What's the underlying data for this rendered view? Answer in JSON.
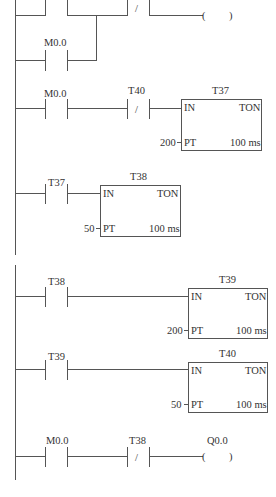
{
  "diagram": {
    "type": "ladder-logic",
    "rungs": [
      {
        "id": 1,
        "elements": [
          {
            "kind": "contact-no",
            "label": ""
          },
          {
            "kind": "contact-no-parallel",
            "label": "M0.0"
          },
          {
            "kind": "contact-nc",
            "label": ""
          },
          {
            "kind": "coil",
            "label": ""
          }
        ]
      },
      {
        "id": 2,
        "elements": [
          {
            "kind": "contact-no",
            "label": "M0.0"
          },
          {
            "kind": "contact-nc",
            "label": "T40"
          },
          {
            "kind": "timer",
            "name": "T37",
            "in": "IN",
            "type": "TON",
            "pt_label": "PT",
            "pt_value": "200",
            "base": "100 ms"
          }
        ]
      },
      {
        "id": 3,
        "elements": [
          {
            "kind": "contact-no",
            "label": "T37"
          },
          {
            "kind": "timer",
            "name": "T38",
            "in": "IN",
            "type": "TON",
            "pt_label": "PT",
            "pt_value": "50",
            "base": "100 ms"
          }
        ]
      },
      {
        "id": 4,
        "elements": [
          {
            "kind": "contact-no",
            "label": "T38"
          },
          {
            "kind": "timer",
            "name": "T39",
            "in": "IN",
            "type": "TON",
            "pt_label": "PT",
            "pt_value": "200",
            "base": "100 ms"
          }
        ]
      },
      {
        "id": 5,
        "elements": [
          {
            "kind": "contact-no",
            "label": "T39"
          },
          {
            "kind": "timer",
            "name": "T40",
            "in": "IN",
            "type": "TON",
            "pt_label": "PT",
            "pt_value": "50",
            "base": "100 ms"
          }
        ]
      },
      {
        "id": 6,
        "elements": [
          {
            "kind": "contact-no",
            "label": "M0.0"
          },
          {
            "kind": "contact-nc",
            "label": "T38"
          },
          {
            "kind": "coil",
            "label": "Q0.0"
          }
        ]
      }
    ],
    "labels": {
      "r1_parallel": "M0.0",
      "r2_contact": "M0.0",
      "r2_nc": "T40",
      "r2_timer": "T37",
      "r3_contact": "T37",
      "r3_timer": "T38",
      "r4_contact": "T38",
      "r4_timer": "T39",
      "r5_contact": "T39",
      "r5_timer": "T40",
      "r6_contact": "M0.0",
      "r6_nc": "T38",
      "r6_coil": "Q0.0",
      "in": "IN",
      "ton": "TON",
      "pt": "PT",
      "base": "100 ms",
      "pt200": "200",
      "pt50": "50",
      "nc_slash": "/",
      "coil_open": "(",
      "coil_close": ")"
    }
  }
}
